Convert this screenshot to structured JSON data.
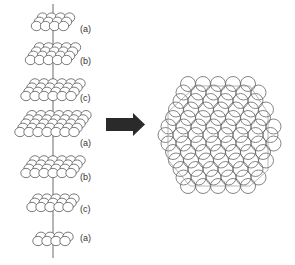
{
  "diagram": {
    "stack": {
      "layers": [
        {
          "label": "(a)",
          "y": 24,
          "cols": 4,
          "rows": 3,
          "width": 40,
          "label_y": 30
        },
        {
          "label": "(b)",
          "y": 58,
          "cols": 5,
          "rows": 4,
          "width": 52,
          "label_y": 62
        },
        {
          "label": "(c)",
          "y": 94,
          "cols": 6,
          "rows": 4,
          "width": 62,
          "label_y": 99
        },
        {
          "label": "(a)",
          "y": 130,
          "cols": 7,
          "rows": 5,
          "width": 72,
          "label_y": 144
        },
        {
          "label": "(b)",
          "y": 171,
          "cols": 6,
          "rows": 4,
          "width": 60,
          "label_y": 178
        },
        {
          "label": "(c)",
          "y": 205,
          "cols": 5,
          "rows": 3,
          "width": 52,
          "label_y": 210
        },
        {
          "label": "(a)",
          "y": 239,
          "cols": 4,
          "rows": 2,
          "width": 40,
          "label_y": 239
        }
      ]
    },
    "arrow": {
      "direction": "right",
      "color": "#2a2a2a"
    },
    "cluster": {
      "shape": "cuboctahedron",
      "stroke": "#555555"
    }
  }
}
